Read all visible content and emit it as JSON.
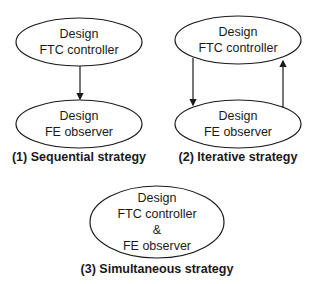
{
  "diagram": {
    "sequential": {
      "top_node": {
        "line1": "Design",
        "line2": "FTC controller"
      },
      "bottom_node": {
        "line1": "Design",
        "line2": "FE observer"
      },
      "caption": "(1) Sequential strategy"
    },
    "iterative": {
      "top_node": {
        "line1": "Design",
        "line2": "FTC controller"
      },
      "bottom_node": {
        "line1": "Design",
        "line2": "FE observer"
      },
      "caption": "(2) Iterative strategy"
    },
    "simultaneous": {
      "node": {
        "line1": "Design",
        "line2": "FTC controller",
        "line3": "&",
        "line4": "FE observer"
      },
      "caption": "(3) Simultaneous strategy"
    }
  }
}
